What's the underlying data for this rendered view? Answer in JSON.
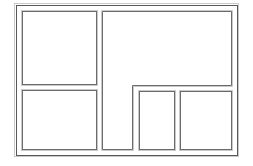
{
  "diagram": {
    "type": "panel-layout-wireframe",
    "background_color": "#ffffff",
    "frame": {
      "name": "outer-frame",
      "label": "",
      "stroke_color": "#58585a",
      "inner_stroke_color": "#c9c9cb",
      "x": 14,
      "y": 3,
      "width": 225,
      "height": 154
    },
    "panels": [
      {
        "id": "panel-top-left",
        "label": "",
        "shape": "rect",
        "x": 21,
        "y": 10,
        "width": 76,
        "height": 75,
        "stroke_color": "#6b6b6d",
        "fill_color": "#ffffff"
      },
      {
        "id": "panel-bottom-left",
        "label": "",
        "shape": "rect",
        "x": 21,
        "y": 89,
        "width": 76,
        "height": 61,
        "stroke_color": "#6b6b6d",
        "fill_color": "#ffffff"
      },
      {
        "id": "panel-main-right-l-shape",
        "label": "",
        "shape": "polygon",
        "points": "101,10 232,10 232,86 133,86 133,150 101,150",
        "stroke_color": "#6b6b6d",
        "fill_color": "#ffffff"
      },
      {
        "id": "panel-bottom-middle",
        "label": "",
        "shape": "rect",
        "x": 138,
        "y": 90,
        "width": 37,
        "height": 60,
        "stroke_color": "#6b6b6d",
        "fill_color": "#ffffff"
      },
      {
        "id": "panel-bottom-right",
        "label": "",
        "shape": "rect",
        "x": 179,
        "y": 90,
        "width": 53,
        "height": 60,
        "stroke_color": "#6b6b6d",
        "fill_color": "#ffffff"
      }
    ]
  }
}
